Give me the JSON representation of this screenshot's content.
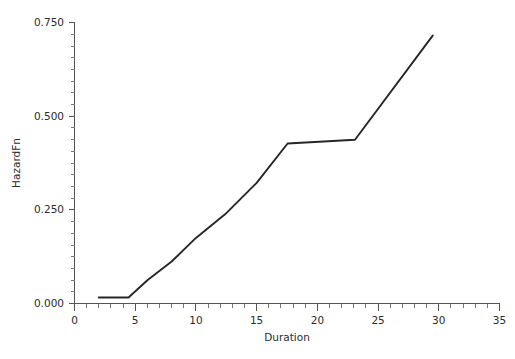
{
  "chart_data": {
    "type": "line",
    "title": "",
    "xlabel": "Duration",
    "ylabel": "HazardFn",
    "xlim": [
      0,
      35
    ],
    "ylim": [
      0.0,
      0.75
    ],
    "grid": false,
    "legend": null,
    "x_ticks": [
      0,
      5,
      10,
      15,
      20,
      25,
      30,
      35
    ],
    "x_tick_labels": [
      "0",
      "5",
      "10",
      "15",
      "20",
      "25",
      "30",
      "35"
    ],
    "x_minor_step": 1,
    "y_ticks": [
      0.0,
      0.25,
      0.5,
      0.75
    ],
    "y_tick_labels": [
      "0.000",
      "0.250",
      "0.500",
      "0.750"
    ],
    "y_minor_step": 0.03125,
    "series": [
      {
        "name": "HazardFn",
        "color": "#262626",
        "x": [
          2.0,
          4.45,
          6.0,
          8.0,
          10.0,
          12.4,
          15.0,
          17.55,
          23.1,
          29.5
        ],
        "y": [
          0.016,
          0.016,
          0.062,
          0.112,
          0.175,
          0.238,
          0.322,
          0.427,
          0.437,
          0.715
        ]
      }
    ]
  },
  "axis": {
    "x_title": "Duration",
    "y_title": "HazardFn"
  }
}
